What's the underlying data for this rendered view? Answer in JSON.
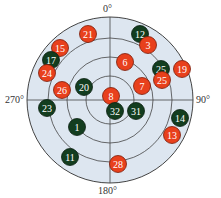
{
  "chart_data": {
    "type": "scatter",
    "subtype": "polar",
    "title": "",
    "angle_labels": [
      "0°",
      "90°",
      "180°",
      "270°"
    ],
    "rings": 4,
    "grid": true,
    "colors": {
      "red": "#e8401c",
      "green": "#133d1f",
      "background": "#dde6f0",
      "grid": "#444444"
    },
    "points": [
      {
        "label": "21",
        "color": "red",
        "x": 88,
        "y": 34
      },
      {
        "label": "12",
        "color": "green",
        "x": 140,
        "y": 34
      },
      {
        "label": "3",
        "color": "red",
        "x": 148,
        "y": 45
      },
      {
        "label": "15",
        "color": "red",
        "x": 60,
        "y": 48
      },
      {
        "label": "17",
        "color": "green",
        "x": 51,
        "y": 60
      },
      {
        "label": "6",
        "color": "red",
        "x": 125,
        "y": 62
      },
      {
        "label": "25",
        "color": "green",
        "x": 161,
        "y": 69
      },
      {
        "label": "19",
        "color": "red",
        "x": 182,
        "y": 69
      },
      {
        "label": "24",
        "color": "red",
        "x": 47,
        "y": 73
      },
      {
        "label": "25",
        "color": "red",
        "x": 162,
        "y": 80
      },
      {
        "label": "7",
        "color": "red",
        "x": 142,
        "y": 86
      },
      {
        "label": "20",
        "color": "green",
        "x": 84,
        "y": 87
      },
      {
        "label": "26",
        "color": "red",
        "x": 62,
        "y": 90
      },
      {
        "label": "8",
        "color": "red",
        "x": 111,
        "y": 96
      },
      {
        "label": "23",
        "color": "green",
        "x": 47,
        "y": 108
      },
      {
        "label": "32",
        "color": "green",
        "x": 115,
        "y": 111
      },
      {
        "label": "31",
        "color": "green",
        "x": 136,
        "y": 111
      },
      {
        "label": "14",
        "color": "green",
        "x": 180,
        "y": 118
      },
      {
        "label": "1",
        "color": "green",
        "x": 77,
        "y": 127
      },
      {
        "label": "13",
        "color": "red",
        "x": 172,
        "y": 135
      },
      {
        "label": "11",
        "color": "green",
        "x": 70,
        "y": 157
      },
      {
        "label": "28",
        "color": "red",
        "x": 118,
        "y": 164
      }
    ]
  },
  "labels": {
    "top": "0°",
    "right": "90°",
    "bottom": "180°",
    "left": "270°"
  }
}
